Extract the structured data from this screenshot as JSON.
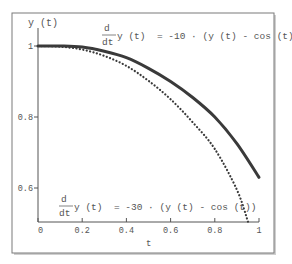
{
  "chart_data": {
    "type": "line",
    "title": "",
    "xlabel": "t",
    "ylabel": "y (t)",
    "xlim": [
      0,
      1
    ],
    "ylim": [
      0.505,
      1.0
    ],
    "x_ticks": [
      {
        "value": 0,
        "label": "0"
      },
      {
        "value": 0.2,
        "label": "0.2"
      },
      {
        "value": 0.4,
        "label": "0.4"
      },
      {
        "value": 0.6,
        "label": "0.6"
      },
      {
        "value": 0.8,
        "label": "0.8"
      },
      {
        "value": 1,
        "label": "1"
      }
    ],
    "y_ticks": [
      {
        "value": 1,
        "label": "1"
      },
      {
        "value": 0.8,
        "label": "0.8"
      },
      {
        "value": 0.6,
        "label": "0.6"
      }
    ],
    "grid": false,
    "legend": "none",
    "series": [
      {
        "name": "d/dt y(t) = -10·(y(t) - cos(t))",
        "style": "solid",
        "color": "#3a3a3a",
        "x": [
          0,
          0.1,
          0.2,
          0.3,
          0.4,
          0.5,
          0.6,
          0.7,
          0.8,
          0.9,
          1.0
        ],
        "y": [
          1.0,
          1.0,
          0.997,
          0.985,
          0.967,
          0.937,
          0.9,
          0.855,
          0.8,
          0.725,
          0.63
        ]
      },
      {
        "name": "d/dt y(t) = -30·(y(t) - cos(t))",
        "style": "dotted",
        "color": "#3a3a3a",
        "x": [
          0,
          0.1,
          0.2,
          0.3,
          0.4,
          0.5,
          0.6,
          0.7,
          0.8,
          0.9,
          0.95
        ],
        "y": [
          1.0,
          0.998,
          0.99,
          0.972,
          0.944,
          0.902,
          0.85,
          0.785,
          0.71,
          0.595,
          0.505
        ]
      }
    ],
    "annotations": [
      {
        "id": "eq-top",
        "numerator": "d",
        "denominator": "dt",
        "text": "y (t)  = -10 · (y (t) - cos (t))"
      },
      {
        "id": "eq-bottom",
        "numerator": "d",
        "denominator": "dt",
        "text": "y (t)  = -30 · (y (t) - cos (t))"
      }
    ]
  }
}
